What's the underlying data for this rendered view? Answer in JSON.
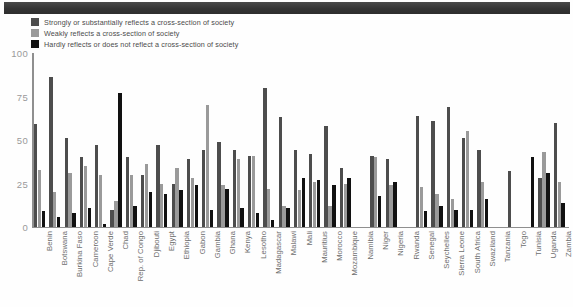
{
  "chart_data": {
    "type": "bar",
    "title": "",
    "subtitle": "",
    "xlabel": "",
    "ylabel": "",
    "ylim": [
      0,
      100
    ],
    "yticks": [
      0,
      25,
      50,
      75,
      100
    ],
    "grid": false,
    "legend_position": "top-left",
    "orientation": "vertical",
    "categories": [
      "Benin",
      "Botswana",
      "Burkina Faso",
      "Cameroon",
      "Cape Verde",
      "Chad",
      "Rep. of Congo",
      "Djibouti",
      "Egypt",
      "Ethiopia",
      "Gabon",
      "Gambia",
      "Ghana",
      "Kenya",
      "Lesotho",
      "Madagascar",
      "Malawi",
      "Mali",
      "Mauritius",
      "Morocco",
      "Mozambique",
      "Namibia",
      "Niger",
      "Nigeria",
      "Rwanda",
      "Senegal",
      "Seychelles",
      "Sierra Leone",
      "South Africa",
      "Swaziland",
      "Tanzania",
      "Togo",
      "Tunisia",
      "Uganda",
      "Zambia"
    ],
    "series": [
      {
        "name": "Strongly or substantially reflects a cross-section of society",
        "color": "#4d4d4d",
        "values": [
          59,
          86,
          51,
          40,
          47,
          10,
          40,
          30,
          47,
          25,
          39,
          44,
          49,
          44,
          41,
          80,
          63,
          44,
          42,
          58,
          34,
          0,
          41,
          39,
          0,
          64,
          61,
          69,
          51,
          44,
          0,
          32,
          0,
          28,
          60
        ]
      },
      {
        "name": "Weakly reflects a cross-section of society",
        "color": "#9a9a9a",
        "values": [
          33,
          20,
          31,
          35,
          30,
          15,
          30,
          36,
          25,
          34,
          28,
          70,
          24,
          39,
          41,
          22,
          12,
          21,
          26,
          12,
          25,
          0,
          40,
          24,
          0,
          23,
          19,
          16,
          55,
          26,
          0,
          0,
          0,
          43,
          26
        ]
      },
      {
        "name": "Hardly reflects or does not reflect a cross-section of society",
        "color": "#111111",
        "values": [
          9,
          6,
          8,
          11,
          2,
          77,
          12,
          20,
          19,
          21,
          24,
          10,
          22,
          11,
          8,
          4,
          11,
          28,
          27,
          24,
          28,
          0,
          18,
          26,
          0,
          9,
          12,
          10,
          10,
          16,
          0,
          0,
          40,
          31,
          14
        ]
      }
    ]
  },
  "legend": {
    "items": [
      {
        "label": "Strongly or substantially reflects a cross-section of society",
        "color": "#4d4d4d"
      },
      {
        "label": "Weakly reflects a cross-section of society",
        "color": "#9a9a9a"
      },
      {
        "label": "Hardly reflects or does not reflect a cross-section of society",
        "color": "#111111"
      }
    ]
  }
}
